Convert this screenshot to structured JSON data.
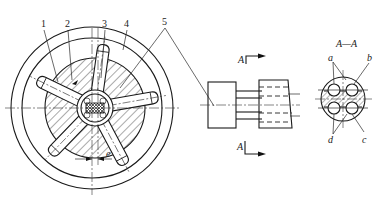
{
  "diagram": {
    "type": "mechanical-drawing",
    "views": [
      {
        "id": "front-view",
        "description": "circular cross-section with five radial pistons"
      },
      {
        "id": "side-view",
        "description": "side elevation with section marks A"
      },
      {
        "id": "section-view",
        "description": "section A—A"
      }
    ]
  },
  "front_view": {
    "part_labels": [
      "1",
      "2",
      "3",
      "4",
      "5"
    ],
    "eccentricity_label": "e",
    "piston_count": 5
  },
  "side_view": {
    "section_mark_top": "A",
    "section_mark_bottom": "A"
  },
  "section_view": {
    "title": "A—A",
    "labels": {
      "a": "a",
      "b": "b",
      "c": "c",
      "d": "d"
    }
  },
  "colors": {
    "line": "#1a1a1a",
    "background": "#ffffff"
  }
}
